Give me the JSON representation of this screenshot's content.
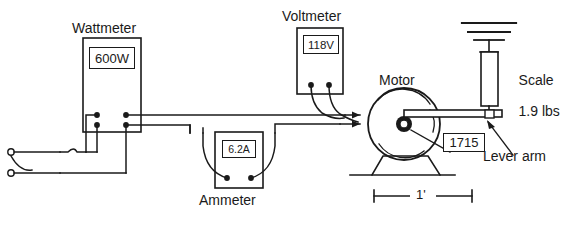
{
  "diagram": {
    "line_color": "#1a1a1a",
    "background": "#ffffff"
  },
  "instruments": {
    "wattmeter": {
      "label": "Wattmeter",
      "reading": "600W"
    },
    "voltmeter": {
      "label": "Voltmeter",
      "reading": "118V"
    },
    "ammeter": {
      "label": "Ammeter",
      "reading": "6.2A"
    }
  },
  "motor": {
    "label": "Motor",
    "speed_callout": "1715"
  },
  "scale": {
    "label_line1": "Scale",
    "label_line2": "1.9 lbs"
  },
  "lever": {
    "label": "Lever arm"
  },
  "dimension": {
    "length_label": "1'"
  }
}
